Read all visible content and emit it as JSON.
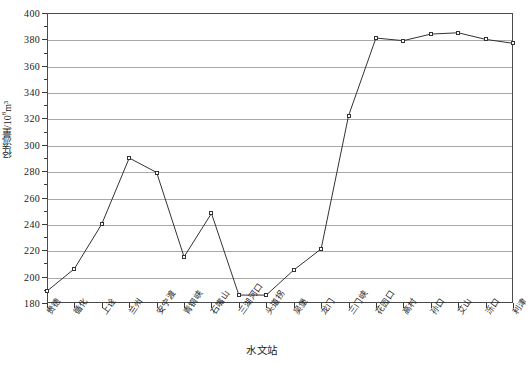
{
  "chart_data": {
    "type": "line",
    "title": "",
    "xlabel": "水文站",
    "ylabel": "径流量/10⁸m³",
    "ylabel_main": "径流量/10",
    "ylabel_exp": "8",
    "ylabel_unit": "m³",
    "ylim": [
      180,
      400
    ],
    "ytick_step": 20,
    "yticks": [
      180,
      200,
      220,
      240,
      260,
      280,
      300,
      320,
      340,
      360,
      380,
      400
    ],
    "ytick_labels": [
      "180",
      "200",
      "220",
      "240",
      "260",
      "280",
      "300",
      "320",
      "340",
      "360",
      "380",
      "400"
    ],
    "grid": "horizontal",
    "legend": "none",
    "marker": "open-square",
    "line_color": "#333333",
    "grid_color": "#a9a9a9",
    "categories": [
      "贵德",
      "循化",
      "上诠",
      "兰州",
      "安宁渡",
      "青铜峡",
      "石嘴山",
      "三湖河口",
      "头道拐",
      "吴堡",
      "龙门",
      "三门峡",
      "花园口",
      "高村",
      "孙口",
      "艾山",
      "泺口",
      "利津"
    ],
    "values": [
      189,
      206,
      240,
      290,
      279,
      215,
      248,
      186,
      186,
      205,
      221,
      322,
      381,
      379,
      384,
      385,
      380,
      377
    ],
    "series": [
      {
        "name": "径流量",
        "values": [
          189,
          206,
          240,
          290,
          279,
          215,
          248,
          186,
          186,
          205,
          221,
          322,
          381,
          379,
          384,
          385,
          380,
          377
        ]
      }
    ]
  }
}
